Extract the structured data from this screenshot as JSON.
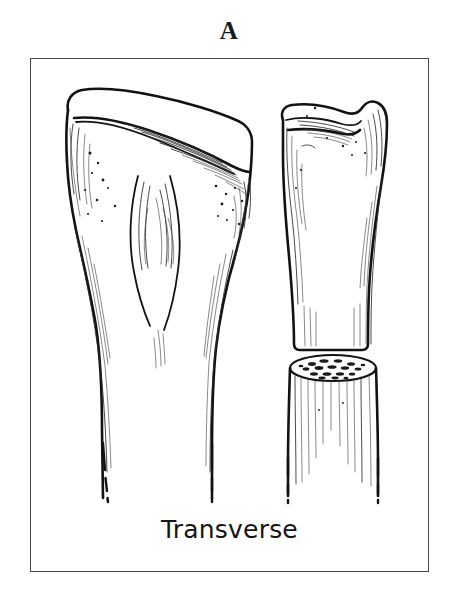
{
  "figure": {
    "panel_letter": "A",
    "caption": "Transverse",
    "frame_color": "#4a4a4a",
    "ink_color": "#121212",
    "background_color": "#ffffff"
  },
  "illustration": {
    "subject": "proximal tibia transverse fracture",
    "style": "pen-and-ink line drawing",
    "views": [
      {
        "name": "anterior-view-tibia",
        "label": "left bone, anterior view of proximal tibia with shaft",
        "has_tibial_tuberosity": true,
        "shaft_ends_in_dashes": true
      },
      {
        "name": "lateral-view-tibia-proximal-fragment",
        "label": "right upper fragment, lateral view, cut transversely",
        "cut_type": "transverse"
      },
      {
        "name": "lateral-view-tibia-distal-fragment",
        "label": "right lower fragment showing transverse cut surface",
        "cut_surface": "cancellous bone speckle",
        "shaft_ends_in_dashes": true
      }
    ]
  }
}
